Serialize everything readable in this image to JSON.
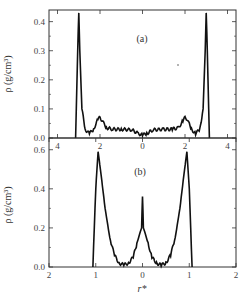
{
  "chart_data": [
    {
      "panel": "(a)",
      "type": "line",
      "title": "",
      "panel_label": "(a)",
      "xlabel": "",
      "ylabel": "ρ (g/cm³)",
      "xlim": [
        -4.4,
        4.4
      ],
      "ylim": [
        0.0,
        0.44
      ],
      "xticks": [
        -4,
        -2,
        0,
        2,
        4
      ],
      "xtick_labels": [
        "4",
        "2",
        "0",
        "2",
        "4"
      ],
      "yticks": [
        0.0,
        0.1,
        0.2,
        0.3,
        0.4
      ],
      "ytick_labels": [
        "0.0",
        "0.1",
        "0.2",
        "0.3",
        "0.4"
      ],
      "grid": false,
      "series": [
        {
          "name": "density profile (a)",
          "x": [
            -3.15,
            -3.05,
            -3.0,
            -2.95,
            -2.85,
            -2.7,
            -2.5,
            -2.3,
            -2.1,
            -2.0,
            -1.9,
            -1.7,
            -1.4,
            -1.0,
            -0.5,
            -0.2,
            0.0,
            0.2,
            0.5,
            1.0,
            1.4,
            1.7,
            1.9,
            2.0,
            2.1,
            2.3,
            2.5,
            2.7,
            2.85,
            2.95,
            3.0,
            3.05,
            3.15
          ],
          "y": [
            0.0,
            0.3,
            0.43,
            0.3,
            0.1,
            0.03,
            0.015,
            0.03,
            0.065,
            0.07,
            0.06,
            0.035,
            0.03,
            0.03,
            0.028,
            0.015,
            0.01,
            0.015,
            0.028,
            0.03,
            0.03,
            0.035,
            0.06,
            0.07,
            0.065,
            0.03,
            0.015,
            0.03,
            0.1,
            0.3,
            0.43,
            0.3,
            0.0
          ]
        }
      ],
      "annotations": [
        "(a)"
      ]
    },
    {
      "panel": "(b)",
      "type": "line",
      "title": "",
      "panel_label": "(b)",
      "xlabel": "r*",
      "ylabel": "ρ (g/cm³)",
      "xlim": [
        -2.0,
        2.0
      ],
      "ylim": [
        0.0,
        0.66
      ],
      "xticks": [
        -2,
        -1,
        0,
        1,
        2
      ],
      "xtick_labels": [
        "2",
        "1",
        "0",
        "1",
        "2"
      ],
      "yticks": [
        0.0,
        0.2,
        0.4,
        0.6
      ],
      "ytick_labels": [
        "0.0",
        "0.2",
        "0.4",
        "0.6"
      ],
      "grid": false,
      "series": [
        {
          "name": "density profile (b)",
          "x": [
            -1.06,
            -1.0,
            -0.95,
            -0.9,
            -0.8,
            -0.7,
            -0.6,
            -0.5,
            -0.4,
            -0.3,
            -0.2,
            -0.12,
            -0.06,
            -0.02,
            0.0,
            0.02,
            0.06,
            0.12,
            0.2,
            0.3,
            0.4,
            0.5,
            0.6,
            0.7,
            0.8,
            0.9,
            0.95,
            1.0,
            1.06
          ],
          "y": [
            0.0,
            0.4,
            0.59,
            0.5,
            0.3,
            0.15,
            0.06,
            0.02,
            0.01,
            0.02,
            0.05,
            0.12,
            0.17,
            0.2,
            0.36,
            0.2,
            0.17,
            0.12,
            0.05,
            0.02,
            0.01,
            0.02,
            0.06,
            0.15,
            0.3,
            0.5,
            0.59,
            0.4,
            0.0
          ]
        }
      ],
      "annotations": [
        "(b)"
      ]
    }
  ],
  "figure": {
    "panel_a_label": "(a)",
    "panel_b_label": "(b)",
    "y_axis_label": "ρ (g/cm³)",
    "x_axis_label": "r*"
  }
}
